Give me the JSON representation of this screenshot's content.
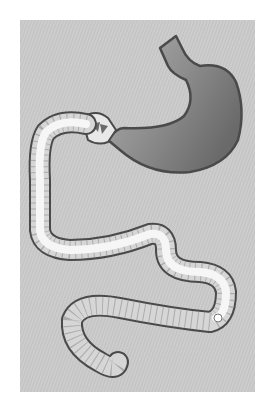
{
  "figure": {
    "caption": "",
    "colors": {
      "page_background": "#ffffff",
      "panel_background": "#c8c8c8",
      "outline": "#4a4a4a",
      "stomach_fill": "#8a8a8a",
      "intestine_lumen": "#f4f4f4",
      "intestine_wall": "#d8d8d8"
    },
    "parts": [
      {
        "id": "esophagus-stump",
        "label": "Esophagus"
      },
      {
        "id": "stomach",
        "label": "Stomach"
      },
      {
        "id": "pylorus",
        "label": "Pyloric valve"
      },
      {
        "id": "small-intestine",
        "label": "Small intestine"
      }
    ]
  }
}
